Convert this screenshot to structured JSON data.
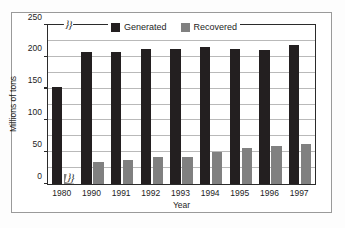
{
  "chart_data": {
    "type": "bar",
    "title": "",
    "xlabel": "Year",
    "ylabel": "Millions of tons",
    "categories": [
      "1980",
      "1990",
      "1991",
      "1992",
      "1993",
      "1994",
      "1995",
      "1996",
      "1997"
    ],
    "series": [
      {
        "name": "Generated",
        "color": "#231f20",
        "values": [
          152,
          207,
          207,
          212,
          213,
          215,
          213,
          210,
          218
        ]
      },
      {
        "name": "Recovered",
        "color": "#808080",
        "values": [
          16,
          34,
          38,
          42,
          42,
          50,
          56,
          60,
          63
        ]
      }
    ],
    "ylim": [
      0,
      250
    ],
    "yticks": [
      0,
      50,
      100,
      150,
      200,
      250
    ],
    "ytick_labels": [
      "0",
      "50",
      "100",
      "150",
      "200",
      "250"
    ],
    "gridlines": [
      25,
      50,
      75,
      100,
      125,
      150,
      175,
      200,
      225
    ],
    "grid": true,
    "legend_position": "top-center",
    "axis_break_between": [
      "1980",
      "1990"
    ],
    "axis_break_symbol": "}}"
  }
}
